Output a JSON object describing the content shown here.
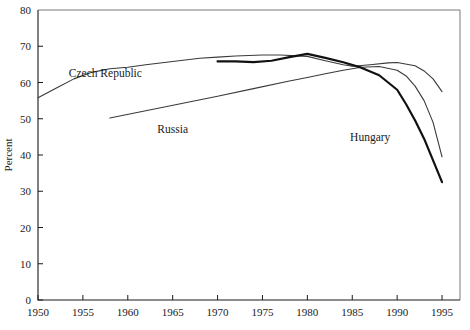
{
  "chart_data": {
    "type": "line",
    "title": "",
    "xlabel": "",
    "ylabel": "Percent",
    "xlim": [
      1950,
      1997
    ],
    "ylim": [
      0,
      80
    ],
    "xticks": [
      "1950",
      "1955",
      "1960",
      "1965",
      "1970",
      "1975",
      "1980",
      "1985",
      "1990",
      "1995"
    ],
    "xtick_values": [
      1950,
      1955,
      1960,
      1965,
      1970,
      1975,
      1980,
      1985,
      1990,
      1995
    ],
    "yticks": [
      "0",
      "10",
      "20",
      "30",
      "40",
      "50",
      "60",
      "70",
      "80"
    ],
    "ytick_values": [
      0,
      10,
      20,
      30,
      40,
      50,
      60,
      70,
      80
    ],
    "grid": false,
    "legend_position": "inline-annotations",
    "series": [
      {
        "name": "Czech Republic",
        "color": "#3a3a3a",
        "width": 1.1,
        "label_x": 1957.5,
        "label_y": 61.5,
        "points": [
          [
            1950,
            55.8
          ],
          [
            1952,
            58.4
          ],
          [
            1954,
            61.0
          ],
          [
            1956,
            62.8
          ],
          [
            1958,
            63.8
          ],
          [
            1960,
            64.2
          ],
          [
            1962,
            64.9
          ],
          [
            1965,
            65.8
          ],
          [
            1968,
            66.7
          ],
          [
            1970,
            67.0
          ],
          [
            1972,
            67.3
          ],
          [
            1975,
            67.6
          ],
          [
            1977,
            67.6
          ],
          [
            1980,
            67.2
          ],
          [
            1982,
            66.0
          ],
          [
            1984,
            64.9
          ],
          [
            1985,
            64.5
          ],
          [
            1987,
            64.9
          ],
          [
            1989,
            65.4
          ],
          [
            1990,
            65.5
          ],
          [
            1992,
            64.6
          ],
          [
            1993,
            63.2
          ],
          [
            1994,
            61.0
          ],
          [
            1995,
            57.5
          ]
        ]
      },
      {
        "name": "Russia",
        "color": "#3a3a3a",
        "width": 1.1,
        "label_x": 1965.0,
        "label_y": 46.0,
        "points": [
          [
            1958,
            50.2
          ],
          [
            1962,
            52.2
          ],
          [
            1966,
            54.2
          ],
          [
            1970,
            56.2
          ],
          [
            1974,
            58.3
          ],
          [
            1978,
            60.4
          ],
          [
            1980,
            61.4
          ],
          [
            1982,
            62.4
          ],
          [
            1984,
            63.4
          ],
          [
            1986,
            64.2
          ],
          [
            1988,
            64.4
          ],
          [
            1990,
            63.4
          ],
          [
            1991,
            61.8
          ],
          [
            1992,
            59.0
          ],
          [
            1993,
            55.0
          ],
          [
            1994,
            49.0
          ],
          [
            1995,
            39.5
          ]
        ]
      },
      {
        "name": "Hungary",
        "color": "#111111",
        "width": 2.2,
        "label_x": 1987.0,
        "label_y": 44.0,
        "points": [
          [
            1970,
            65.8
          ],
          [
            1972,
            65.8
          ],
          [
            1974,
            65.6
          ],
          [
            1976,
            66.0
          ],
          [
            1978,
            67.0
          ],
          [
            1980,
            67.9
          ],
          [
            1982,
            66.8
          ],
          [
            1984,
            65.6
          ],
          [
            1986,
            64.1
          ],
          [
            1988,
            62.0
          ],
          [
            1990,
            58.0
          ],
          [
            1991,
            54.0
          ],
          [
            1992,
            49.5
          ],
          [
            1993,
            44.5
          ],
          [
            1994,
            38.5
          ],
          [
            1995,
            32.5
          ]
        ]
      }
    ]
  },
  "axes": {
    "y_title": "Percent"
  }
}
